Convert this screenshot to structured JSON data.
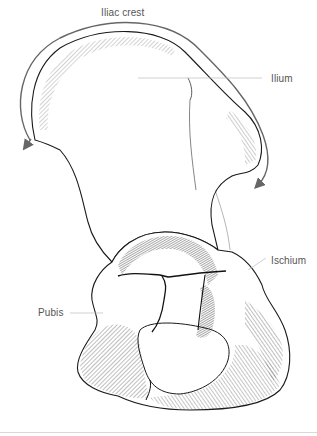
{
  "figure": {
    "labels": [
      {
        "id": "iliac-crest",
        "text": "Iliac crest",
        "x": 101,
        "y": 7
      },
      {
        "id": "ilium",
        "text": "Ilium",
        "x": 271,
        "y": 73
      },
      {
        "id": "ischium",
        "text": "Ischium",
        "x": 271,
        "y": 255
      },
      {
        "id": "pubis",
        "text": "Pubis",
        "x": 38,
        "y": 305
      }
    ],
    "colors": {
      "line": "#1a1a1a",
      "hatch": "#333333",
      "label": "#555555",
      "leader": "#bbbbbb",
      "arrow": "#666666",
      "rule": "#d8d8d8"
    }
  }
}
